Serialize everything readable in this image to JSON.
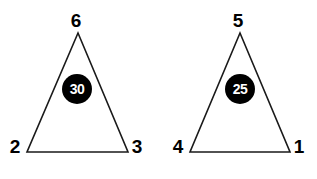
{
  "canvas": {
    "width": 317,
    "height": 179,
    "background_color": "#ffffff"
  },
  "style": {
    "stroke_color": "#1a1a1a",
    "stroke_width": 1.6,
    "fill_color": "#ffffff",
    "label_color": "#000000",
    "badge_fill_color": "#000000",
    "badge_text_color": "#ffffff"
  },
  "figures": [
    {
      "id": "triangle-left",
      "points": "78,33 27,152 128,152",
      "badge": {
        "value": "30",
        "cx": 77,
        "cy": 89,
        "r": 15
      },
      "vertices": [
        {
          "name": "apex",
          "label": "6",
          "x": 76,
          "y": 20
        },
        {
          "name": "bottom-left",
          "label": "2",
          "x": 15,
          "y": 146
        },
        {
          "name": "bottom-right",
          "label": "3",
          "x": 137,
          "y": 146
        }
      ]
    },
    {
      "id": "triangle-right",
      "points": "240,33 190,152 290,152",
      "badge": {
        "value": "25",
        "cx": 240,
        "cy": 89,
        "r": 15
      },
      "vertices": [
        {
          "name": "apex",
          "label": "5",
          "x": 238,
          "y": 20
        },
        {
          "name": "bottom-left",
          "label": "4",
          "x": 178,
          "y": 146
        },
        {
          "name": "bottom-right",
          "label": "1",
          "x": 299,
          "y": 146
        }
      ]
    }
  ]
}
